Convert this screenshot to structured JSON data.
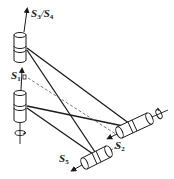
{
  "diagram": {
    "type": "mechanism-schematic",
    "colors": {
      "stroke": "#1a1a1a",
      "background": "#ffffff",
      "dashed": "#555555"
    },
    "labels": {
      "s34": {
        "main": "S",
        "sub1": "3",
        "slash": "/",
        "main2": "S",
        "sub2": "4"
      },
      "s1": {
        "main": "S",
        "sub": "1"
      },
      "s2": {
        "main": "S",
        "sub": "2"
      },
      "s5": {
        "main": "S",
        "sub": "5"
      }
    },
    "nodes": [
      {
        "id": "joint-top",
        "kind": "vertical-cylinder",
        "axis_label": "S3/S4"
      },
      {
        "id": "joint-left",
        "kind": "vertical-cylinder",
        "axis_label": "S1"
      },
      {
        "id": "joint-right",
        "kind": "horizontal-cylinder",
        "axis_label": "S2"
      },
      {
        "id": "joint-bottom",
        "kind": "horizontal-cylinder",
        "axis_label": "S5"
      }
    ],
    "edges": [
      {
        "from": "joint-top",
        "to": "joint-right",
        "style": "solid"
      },
      {
        "from": "joint-top",
        "to": "joint-bottom",
        "style": "solid"
      },
      {
        "from": "joint-left",
        "to": "joint-right",
        "style": "solid"
      },
      {
        "from": "joint-left",
        "to": "joint-bottom",
        "style": "solid"
      },
      {
        "from": "joint-left",
        "to": "joint-right",
        "style": "dashed"
      }
    ],
    "icons": [
      "rotation-arrow-icon-left",
      "rotation-arrow-icon-right"
    ]
  }
}
